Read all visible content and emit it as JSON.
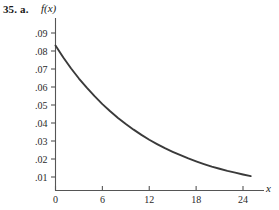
{
  "figure": {
    "problem_number": "35.",
    "problem_part": "a.",
    "y_axis_label": "f(x)",
    "x_axis_label": "x",
    "axis_color": "#555555",
    "curve_color": "#3a3a3a",
    "background_color": "#ffffff"
  },
  "chart_data": {
    "type": "line",
    "title": "",
    "subtitle": "",
    "xlabel": "x",
    "ylabel": "f(x)",
    "xlim": [
      0,
      26
    ],
    "ylim": [
      0,
      0.095
    ],
    "grid": false,
    "legend": null,
    "x_tick_labels": [
      "0",
      "6",
      "12",
      "18",
      "24"
    ],
    "x_tick_values": [
      0,
      6,
      12,
      18,
      24
    ],
    "y_tick_labels": [
      ".09",
      ".08",
      ".07",
      ".06",
      ".05",
      ".04",
      ".03",
      ".02",
      ".01"
    ],
    "y_tick_values": [
      0.09,
      0.08,
      0.07,
      0.06,
      0.05,
      0.04,
      0.03,
      0.02,
      0.01
    ],
    "series": [
      {
        "name": "f(x)",
        "color": "#3a3a3a",
        "x": [
          0,
          1,
          2,
          3,
          4,
          5,
          6,
          7,
          8,
          9,
          10,
          11,
          12,
          13,
          14,
          15,
          16,
          17,
          18,
          19,
          20,
          21,
          22,
          23,
          24,
          25
        ],
        "values": [
          0.083,
          0.0764,
          0.0703,
          0.0647,
          0.0596,
          0.0549,
          0.0505,
          0.0465,
          0.0428,
          0.0394,
          0.0363,
          0.0334,
          0.0307,
          0.0283,
          0.026,
          0.024,
          0.0221,
          0.0203,
          0.0187,
          0.0172,
          0.0158,
          0.0146,
          0.0134,
          0.0124,
          0.0114,
          0.0105
        ]
      }
    ],
    "annotations": []
  }
}
